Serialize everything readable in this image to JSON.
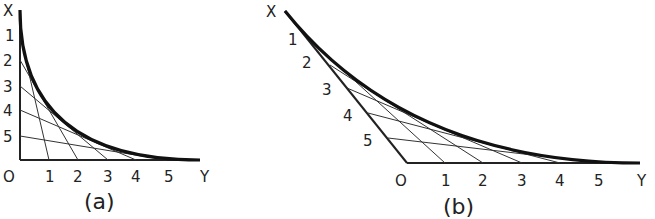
{
  "figures": [
    {
      "id": "a",
      "caption": "(a)",
      "axis_labels": {
        "origin": "O",
        "vertical": "X",
        "horizontal": "Y"
      },
      "vertical_ticks": [
        "1",
        "2",
        "3",
        "4",
        "5"
      ],
      "horizontal_ticks": [
        "1",
        "2",
        "3",
        "4",
        "5"
      ],
      "description": "Right-angle axes; straight lines join point n on X axis to point (n-1)... on Y axis forming an envelope curve"
    },
    {
      "id": "b",
      "caption": "(b)",
      "axis_labels": {
        "origin": "O",
        "vertical": "X",
        "horizontal": "Y"
      },
      "vertical_ticks": [
        "1",
        "2",
        "3",
        "4",
        "5"
      ],
      "horizontal_ticks": [
        "1",
        "2",
        "3",
        "4",
        "5"
      ],
      "description": "Oblique axes; straight lines joining points form an envelope curve"
    }
  ]
}
